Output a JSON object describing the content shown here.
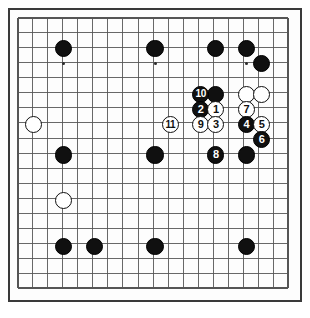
{
  "diagram": {
    "kind": "go-board-diagram",
    "board_size": 19,
    "title": "",
    "caption": "",
    "move_count": 11,
    "colors": {
      "board_background": "#fdfdfd",
      "page_background": "#ffffff",
      "grid_line": "#555555",
      "border": "#3a3a3a",
      "black_stone": "#101010",
      "white_stone": "#ffffff",
      "black_label_text": "#ffffff",
      "white_label_text": "#101010"
    },
    "geometry": {
      "origin_x": 10,
      "origin_y": 10,
      "cell_px": 16.1,
      "stone_radius_px": 8.4
    }
  },
  "stones": [
    {
      "label": "",
      "color": "black",
      "col": 3,
      "row": 2
    },
    {
      "label": "",
      "color": "black",
      "col": 9,
      "row": 2
    },
    {
      "label": "",
      "color": "black",
      "col": 13,
      "row": 2
    },
    {
      "label": "",
      "color": "black",
      "col": 15,
      "row": 2
    },
    {
      "label": "",
      "color": "black",
      "col": 16,
      "row": 3
    },
    {
      "label": "",
      "color": "black",
      "col": 13,
      "row": 5
    },
    {
      "label": "10",
      "color": "black",
      "col": 12,
      "row": 5
    },
    {
      "label": "",
      "color": "white",
      "col": 15,
      "row": 5
    },
    {
      "label": "",
      "color": "white",
      "col": 16,
      "row": 5
    },
    {
      "label": "2",
      "color": "black",
      "col": 12,
      "row": 6
    },
    {
      "label": "1",
      "color": "white",
      "col": 13,
      "row": 6
    },
    {
      "label": "7",
      "color": "white",
      "col": 15,
      "row": 6
    },
    {
      "label": "11",
      "color": "white",
      "col": 10,
      "row": 7
    },
    {
      "label": "9",
      "color": "white",
      "col": 12,
      "row": 7
    },
    {
      "label": "3",
      "color": "white",
      "col": 13,
      "row": 7
    },
    {
      "label": "4",
      "color": "black",
      "col": 15,
      "row": 7
    },
    {
      "label": "5",
      "color": "white",
      "col": 16,
      "row": 7
    },
    {
      "label": "6",
      "color": "black",
      "col": 16,
      "row": 8
    },
    {
      "label": "",
      "color": "white",
      "col": 1,
      "row": 7
    },
    {
      "label": "",
      "color": "black",
      "col": 3,
      "row": 9
    },
    {
      "label": "",
      "color": "black",
      "col": 9,
      "row": 9
    },
    {
      "label": "8",
      "color": "black",
      "col": 13,
      "row": 9
    },
    {
      "label": "",
      "color": "black",
      "col": 15,
      "row": 9
    },
    {
      "label": "",
      "color": "white",
      "col": 3,
      "row": 12
    },
    {
      "label": "",
      "color": "black",
      "col": 3,
      "row": 15
    },
    {
      "label": "",
      "color": "black",
      "col": 5,
      "row": 15
    },
    {
      "label": "",
      "color": "black",
      "col": 9,
      "row": 15
    },
    {
      "label": "",
      "color": "black",
      "col": 15,
      "row": 15
    }
  ],
  "move_list": [
    {
      "n": "1",
      "color": "white"
    },
    {
      "n": "2",
      "color": "black"
    },
    {
      "n": "3",
      "color": "white"
    },
    {
      "n": "4",
      "color": "black"
    },
    {
      "n": "5",
      "color": "white"
    },
    {
      "n": "6",
      "color": "black"
    },
    {
      "n": "7",
      "color": "white"
    },
    {
      "n": "8",
      "color": "black"
    },
    {
      "n": "9",
      "color": "white"
    },
    {
      "n": "10",
      "color": "black"
    },
    {
      "n": "11",
      "color": "white"
    }
  ]
}
